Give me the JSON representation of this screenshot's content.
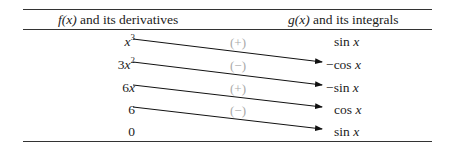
{
  "table": {
    "header": {
      "left_func": "f(x)",
      "left_text": " and its derivatives",
      "right_func": "g(x)",
      "right_text": " and its integrals"
    },
    "rows": [
      {
        "f_base": "x",
        "f_coef": "",
        "f_exp": "3",
        "sign": "(+)",
        "g_prefix": "",
        "g_fn": "sin ",
        "g_var": "x"
      },
      {
        "f_base": "x",
        "f_coef": "3",
        "f_exp": "2",
        "sign": "(−)",
        "g_prefix": "−",
        "g_fn": "cos ",
        "g_var": "x"
      },
      {
        "f_base": "x",
        "f_coef": "6",
        "f_exp": "",
        "sign": "(+)",
        "g_prefix": "−",
        "g_fn": "sin ",
        "g_var": "x"
      },
      {
        "f_base": "",
        "f_coef": "6",
        "f_exp": "",
        "sign": "(−)",
        "g_prefix": "",
        "g_fn": "cos ",
        "g_var": "x"
      },
      {
        "f_base": "",
        "f_coef": "0",
        "f_exp": "",
        "sign": "",
        "g_prefix": "",
        "g_fn": "sin ",
        "g_var": "x"
      }
    ]
  },
  "colors": {
    "rule": "#333333",
    "text": "#222222",
    "sign": "#aaaaaa",
    "arrow": "#111111"
  }
}
